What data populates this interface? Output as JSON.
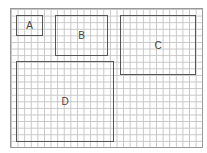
{
  "diagram": {
    "type": "rectangles-on-grid",
    "grid_color": "#c6c6c6",
    "frame_color": "#9a9a9a",
    "rect_border_color": "#555555",
    "rectangles": [
      {
        "label": "A",
        "x": 16,
        "y": 15,
        "w": 27,
        "h": 21
      },
      {
        "label": "B",
        "x": 55,
        "y": 15,
        "w": 53,
        "h": 41
      },
      {
        "label": "C",
        "x": 120,
        "y": 15,
        "w": 76,
        "h": 60
      },
      {
        "label": "D",
        "x": 16,
        "y": 61,
        "w": 98,
        "h": 81
      }
    ]
  }
}
